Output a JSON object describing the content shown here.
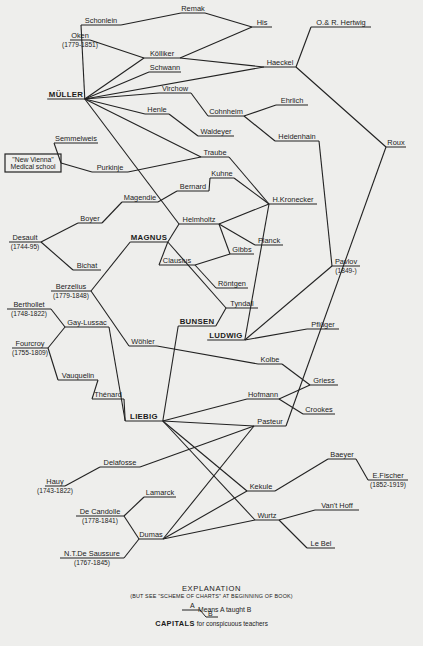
{
  "chart_data": {
    "type": "diagram",
    "nodes": [
      {
        "id": "remak",
        "label": "Remak",
        "x": 193,
        "y": 11
      },
      {
        "id": "his",
        "label": "His",
        "x": 262,
        "y": 25
      },
      {
        "id": "schonlein",
        "label": "Schonlein",
        "x": 101,
        "y": 23
      },
      {
        "id": "hertwig",
        "label": "O.& R. Hertwig",
        "x": 341,
        "y": 25
      },
      {
        "id": "oken",
        "label": "Oken",
        "dates": "(1779-1851)",
        "x": 80,
        "y": 38
      },
      {
        "id": "kolliker",
        "label": "Kölliker",
        "x": 162,
        "y": 56
      },
      {
        "id": "haeckel",
        "label": "Haeckel",
        "x": 280,
        "y": 65
      },
      {
        "id": "schwann",
        "label": "Schwann",
        "x": 165,
        "y": 70
      },
      {
        "id": "muller",
        "label": "MÜLLER",
        "x": 66,
        "y": 97,
        "capital": true
      },
      {
        "id": "virchow",
        "label": "Virchow",
        "x": 175,
        "y": 91
      },
      {
        "id": "ehrlich",
        "label": "Ehrlich",
        "x": 292,
        "y": 103
      },
      {
        "id": "cohnheim",
        "label": "Cohnheim",
        "x": 226,
        "y": 114
      },
      {
        "id": "henle",
        "label": "Henle",
        "x": 157,
        "y": 112
      },
      {
        "id": "heidenhain",
        "label": "Heidenhain",
        "x": 297,
        "y": 139
      },
      {
        "id": "waldeyer",
        "label": "Waldeyer",
        "x": 216,
        "y": 134
      },
      {
        "id": "roux",
        "label": "Roux",
        "x": 396,
        "y": 145
      },
      {
        "id": "semmelweis",
        "label": "Semmelweis",
        "x": 76,
        "y": 141
      },
      {
        "id": "newvienna",
        "label": "\"New Vienna\" Medical school",
        "x": 30,
        "y": 163,
        "box": true
      },
      {
        "id": "traube",
        "label": "Traube",
        "x": 215,
        "y": 155
      },
      {
        "id": "purkinje",
        "label": "Purkinje",
        "x": 110,
        "y": 170
      },
      {
        "id": "kuhne",
        "label": "Kuhne",
        "x": 222,
        "y": 176
      },
      {
        "id": "bernard",
        "label": "Bernard",
        "x": 193,
        "y": 189
      },
      {
        "id": "kronecker",
        "label": "H.Kronecker",
        "x": 293,
        "y": 202
      },
      {
        "id": "magendie",
        "label": "Magendie",
        "x": 140,
        "y": 200
      },
      {
        "id": "helmholtz",
        "label": "Helmholtz",
        "x": 199,
        "y": 222
      },
      {
        "id": "boyer",
        "label": "Boyer",
        "x": 90,
        "y": 221
      },
      {
        "id": "magnus",
        "label": "MAGNUS",
        "x": 149,
        "y": 240,
        "capital": true
      },
      {
        "id": "planck",
        "label": "Planck",
        "x": 269,
        "y": 243
      },
      {
        "id": "desault",
        "label": "Desault",
        "dates": "(1744-95)",
        "x": 25,
        "y": 240
      },
      {
        "id": "gibbs",
        "label": "Gibbs",
        "x": 242,
        "y": 252
      },
      {
        "id": "clausius",
        "label": "Clausius",
        "x": 177,
        "y": 263
      },
      {
        "id": "bichat",
        "label": "Bichat",
        "x": 87,
        "y": 268
      },
      {
        "id": "pavlov",
        "label": "Pavlov",
        "dates": "(1849-)",
        "x": 346,
        "y": 264
      },
      {
        "id": "rontgen",
        "label": "Röntgen",
        "x": 232,
        "y": 286
      },
      {
        "id": "berzelius",
        "label": "Berzelius",
        "dates": "(1779-1848)",
        "x": 71,
        "y": 289
      },
      {
        "id": "tyndall",
        "label": "Tyndall",
        "x": 242,
        "y": 306
      },
      {
        "id": "berthollet",
        "label": "Berthollet",
        "dates": "(1748-1822)",
        "x": 29,
        "y": 307
      },
      {
        "id": "bunsen",
        "label": "BUNSEN",
        "x": 197,
        "y": 324,
        "capital": true
      },
      {
        "id": "gaylussac",
        "label": "Gay-Lussac",
        "x": 87,
        "y": 325
      },
      {
        "id": "ludwig",
        "label": "LUDWIG",
        "x": 226,
        "y": 338,
        "capital": true
      },
      {
        "id": "pfluger",
        "label": "Pflüger",
        "x": 323,
        "y": 327
      },
      {
        "id": "fourcroy",
        "label": "Fourcroy",
        "dates": "(1755-1809)",
        "x": 30,
        "y": 346
      },
      {
        "id": "wohler",
        "label": "Wöhler",
        "x": 143,
        "y": 344
      },
      {
        "id": "kolbe",
        "label": "Kolbe",
        "x": 270,
        "y": 362
      },
      {
        "id": "vauquelin",
        "label": "Vauquelin",
        "x": 78,
        "y": 378
      },
      {
        "id": "griess",
        "label": "Griess",
        "x": 324,
        "y": 383
      },
      {
        "id": "thenard",
        "label": "Thénard",
        "x": 108,
        "y": 397
      },
      {
        "id": "hofmann",
        "label": "Hofmann",
        "x": 263,
        "y": 397
      },
      {
        "id": "crookes",
        "label": "Crookes",
        "x": 319,
        "y": 412
      },
      {
        "id": "liebig",
        "label": "LIEBIG",
        "x": 144,
        "y": 419,
        "capital": true
      },
      {
        "id": "pasteur",
        "label": "Pasteur",
        "x": 270,
        "y": 424
      },
      {
        "id": "baeyer",
        "label": "Baeyer",
        "x": 342,
        "y": 457
      },
      {
        "id": "delafosse",
        "label": "Delafosse",
        "x": 120,
        "y": 465
      },
      {
        "id": "efischer",
        "label": "E.Fischer",
        "dates": "(1852-1919)",
        "x": 388,
        "y": 478
      },
      {
        "id": "hauy",
        "label": "Hauy",
        "dates": "(1743-1822)",
        "x": 55,
        "y": 484
      },
      {
        "id": "lamarck",
        "label": "Lamarck",
        "x": 160,
        "y": 495
      },
      {
        "id": "kekule",
        "label": "Kekule",
        "x": 261,
        "y": 489
      },
      {
        "id": "vanthoff",
        "label": "Van't Hoff",
        "x": 337,
        "y": 508
      },
      {
        "id": "decandolle",
        "label": "De Candolle",
        "dates": "(1778-1841)",
        "x": 100,
        "y": 514
      },
      {
        "id": "wurtz",
        "label": "Wurtz",
        "x": 267,
        "y": 518
      },
      {
        "id": "dumas",
        "label": "Dumas",
        "x": 151,
        "y": 537
      },
      {
        "id": "lebel",
        "label": "Le Bel",
        "x": 321,
        "y": 546
      },
      {
        "id": "saussure",
        "label": "N.T.De Saussure",
        "dates": "(1767-1845)",
        "x": 92,
        "y": 556
      }
    ],
    "edges": [
      [
        "muller",
        "schonlein"
      ],
      [
        "muller",
        "kolliker"
      ],
      [
        "muller",
        "schwann"
      ],
      [
        "muller",
        "haeckel"
      ],
      [
        "muller",
        "virchow"
      ],
      [
        "muller",
        "henle"
      ],
      [
        "muller",
        "traube"
      ],
      [
        "muller",
        "helmholtz"
      ],
      [
        "oken",
        "kolliker"
      ],
      [
        "schonlein",
        "remak"
      ],
      [
        "remak",
        "his"
      ],
      [
        "kolliker",
        "his"
      ],
      [
        "kolliker",
        "haeckel"
      ],
      [
        "haeckel",
        "hertwig"
      ],
      [
        "haeckel",
        "roux"
      ],
      [
        "virchow",
        "cohnheim"
      ],
      [
        "cohnheim",
        "ehrlich"
      ],
      [
        "cohnheim",
        "heidenhain"
      ],
      [
        "heidenhain",
        "pavlov"
      ],
      [
        "henle",
        "waldeyer"
      ],
      [
        "newvienna",
        "semmelweis"
      ],
      [
        "newvienna",
        "purkinje"
      ],
      [
        "purkinje",
        "traube"
      ],
      [
        "traube",
        "kronecker"
      ],
      [
        "kuhne",
        "kronecker"
      ],
      [
        "bernard",
        "kuhne"
      ],
      [
        "magendie",
        "bernard"
      ],
      [
        "boyer",
        "magendie"
      ],
      [
        "desault",
        "boyer"
      ],
      [
        "desault",
        "bichat"
      ],
      [
        "helmholtz",
        "kronecker"
      ],
      [
        "helmholtz",
        "planck"
      ],
      [
        "helmholtz",
        "gibbs"
      ],
      [
        "magnus",
        "helmholtz"
      ],
      [
        "magnus",
        "clausius"
      ],
      [
        "magnus",
        "tyndall"
      ],
      [
        "magnus",
        "berzelius"
      ],
      [
        "clausius",
        "gibbs"
      ],
      [
        "clausius",
        "rontgen"
      ],
      [
        "kronecker",
        "ludwig"
      ],
      [
        "bunsen",
        "tyndall"
      ],
      [
        "bunsen",
        "liebig"
      ],
      [
        "ludwig",
        "pfluger"
      ],
      [
        "ludwig",
        "pavlov"
      ],
      [
        "berzelius",
        "wohler"
      ],
      [
        "berthollet",
        "gaylussac"
      ],
      [
        "fourcroy",
        "gaylussac"
      ],
      [
        "fourcroy",
        "vauquelin"
      ],
      [
        "vauquelin",
        "thenard"
      ],
      [
        "thenard",
        "liebig"
      ],
      [
        "gaylussac",
        "liebig"
      ],
      [
        "wohler",
        "kolbe"
      ],
      [
        "kolbe",
        "griess"
      ],
      [
        "hofmann",
        "griess"
      ],
      [
        "hofmann",
        "crookes"
      ],
      [
        "liebig",
        "hofmann"
      ],
      [
        "liebig",
        "kekule"
      ],
      [
        "liebig",
        "wurtz"
      ],
      [
        "roux",
        "pasteur"
      ],
      [
        "liebig",
        "pasteur"
      ],
      [
        "hauy",
        "delafosse"
      ],
      [
        "delafosse",
        "pasteur"
      ],
      [
        "decandolle",
        "lamarck"
      ],
      [
        "decandolle",
        "dumas"
      ],
      [
        "saussure",
        "dumas"
      ],
      [
        "dumas",
        "pasteur"
      ],
      [
        "dumas",
        "kekule"
      ],
      [
        "dumas",
        "wurtz"
      ],
      [
        "kekule",
        "baeyer"
      ],
      [
        "baeyer",
        "efischer"
      ],
      [
        "wurtz",
        "vanthoff"
      ],
      [
        "wurtz",
        "lebel"
      ]
    ]
  },
  "legend": {
    "title": "EXPLANATION",
    "subtitle": "(BUT SEE \"SCHEME OF CHARTS\" AT BEGINNING OF BOOK)",
    "example_a": "A",
    "example_b": "B",
    "example_meaning": "Means A taught B",
    "capitals_word": "CAPITALS",
    "capitals_rest": "for conspicuous teachers"
  }
}
